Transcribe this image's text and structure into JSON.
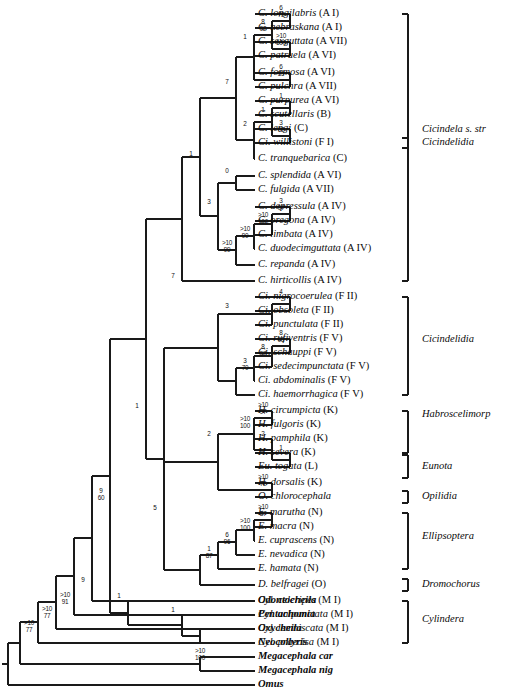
{
  "figure": {
    "type": "phylogenetic-cladogram",
    "width": 517,
    "height": 697,
    "line_color": "#1a1a1a",
    "text_color": "#0a0a0a",
    "background": "#ffffff"
  },
  "taxa": [
    {
      "name": "C. longilabris",
      "code": "(A I)",
      "outgroup": false,
      "y": 14
    },
    {
      "name": "C. nebraskana",
      "code": "(A I)",
      "outgroup": false,
      "y": 28
    },
    {
      "name": "C. sexguttata",
      "code": "(A VII)",
      "outgroup": false,
      "y": 42
    },
    {
      "name": "C. patruela",
      "code": "(A VI)",
      "outgroup": false,
      "y": 56
    },
    {
      "name": "C. formosa",
      "code": "(A VI)",
      "outgroup": false,
      "y": 73
    },
    {
      "name": "C. pulchra",
      "code": "(A VII)",
      "outgroup": false,
      "y": 87
    },
    {
      "name": "C. purpurea",
      "code": "(A VI)",
      "outgroup": false,
      "y": 101
    },
    {
      "name": "C. scutellaris",
      "code": "(B)",
      "outgroup": false,
      "y": 115
    },
    {
      "name": "C. lengi",
      "code": "(C)",
      "outgroup": false,
      "y": 129
    },
    {
      "name": "Ci. willistoni",
      "code": "(F I)",
      "outgroup": false,
      "y": 143
    },
    {
      "name": "C. tranquebarica",
      "code": "(C)",
      "outgroup": false,
      "y": 159
    },
    {
      "name": "C. splendida",
      "code": "(A VI)",
      "outgroup": false,
      "y": 176
    },
    {
      "name": "C. fulgida",
      "code": "(A VII)",
      "outgroup": false,
      "y": 190
    },
    {
      "name": "C. depressula",
      "code": "(A IV)",
      "outgroup": false,
      "y": 207
    },
    {
      "name": "C. oregona",
      "code": "(A IV)",
      "outgroup": false,
      "y": 221
    },
    {
      "name": "C. limbata",
      "code": "(A IV)",
      "outgroup": false,
      "y": 235
    },
    {
      "name": "C. duodecimguttata",
      "code": "(A  IV)",
      "outgroup": false,
      "y": 249
    },
    {
      "name": "C. repanda",
      "code": "(A IV)",
      "outgroup": false,
      "y": 265
    },
    {
      "name": "C. hirticollis",
      "code": "(A IV)",
      "outgroup": false,
      "y": 281
    },
    {
      "name": "Ci. nigrocoerulea",
      "code": "(F II)",
      "outgroup": false,
      "y": 297
    },
    {
      "name": "Ci. obsoleta",
      "code": "(F II)",
      "outgroup": false,
      "y": 311
    },
    {
      "name": "Ci. punctulata",
      "code": "(F II)",
      "outgroup": false,
      "y": 325
    },
    {
      "name": "Ci. rufiventris",
      "code": "(F V)",
      "outgroup": false,
      "y": 339
    },
    {
      "name": "Ci. schauppi",
      "code": "(F V)",
      "outgroup": false,
      "y": 353
    },
    {
      "name": "Ci. sedecimpunctata",
      "code": "(F V)",
      "outgroup": false,
      "y": 367
    },
    {
      "name": "Ci. abdominalis",
      "code": "(F V)",
      "outgroup": false,
      "y": 381
    },
    {
      "name": "Ci. haemorrhagica",
      "code": "(F V)",
      "outgroup": false,
      "y": 395
    },
    {
      "name": "H. circumpicta",
      "code": "(K)",
      "outgroup": false,
      "y": 411
    },
    {
      "name": "H. fulgoris",
      "code": "(K)",
      "outgroup": false,
      "y": 425
    },
    {
      "name": "H. pamphila",
      "code": "(K)",
      "outgroup": false,
      "y": 439
    },
    {
      "name": "H. severa",
      "code": "(K)",
      "outgroup": false,
      "y": 453
    },
    {
      "name": "Eu. togata",
      "code": "(L)",
      "outgroup": false,
      "y": 467
    },
    {
      "name": "H. dorsalis",
      "code": "(K)",
      "outgroup": false,
      "y": 483
    },
    {
      "name": "O. chlorocephala",
      "code": "",
      "outgroup": false,
      "y": 497
    },
    {
      "name": "E. marutha",
      "code": "(N)",
      "outgroup": false,
      "y": 513
    },
    {
      "name": "E. macra",
      "code": "(N)",
      "outgroup": false,
      "y": 527
    },
    {
      "name": "E. cuprascens",
      "code": "(N)",
      "outgroup": false,
      "y": 541
    },
    {
      "name": "E. nevadica",
      "code": "(N)",
      "outgroup": false,
      "y": 555
    },
    {
      "name": "E. hamata",
      "code": "(N)",
      "outgroup": false,
      "y": 569
    },
    {
      "name": "D. belfragei",
      "code": "(O)",
      "outgroup": false,
      "y": 585
    },
    {
      "name": "Cyl. celeripes",
      "code": "(M I)",
      "outgroup": false,
      "y": 601
    },
    {
      "name": "Cyl. unipunctata",
      "code": "(M I)",
      "outgroup": false,
      "y": 615
    },
    {
      "name": "Cyl. lemniscata",
      "code": "(M I)",
      "outgroup": false,
      "y": 629
    },
    {
      "name": "Cyl. praecisa",
      "code": "(M I)",
      "outgroup": false,
      "y": 643
    },
    {
      "name": "Odontocheila",
      "code": "",
      "outgroup": true,
      "y": 601
    },
    {
      "name": "Pentachomia",
      "code": "",
      "outgroup": true,
      "y": 615
    },
    {
      "name": "Oxycheila",
      "code": "",
      "outgroup": true,
      "y": 629
    },
    {
      "name": "Neocollyris",
      "code": "",
      "outgroup": true,
      "y": 643
    },
    {
      "name": "Megacephala car",
      "code": "",
      "outgroup": true,
      "y": 657
    },
    {
      "name": "Megacephala nig",
      "code": "",
      "outgroup": true,
      "y": 671
    },
    {
      "name": "Omus",
      "code": "",
      "outgroup": true,
      "y": 685
    }
  ],
  "tip_layout": {
    "label_x": 258,
    "outgroup_indices": [
      44,
      45,
      46,
      47,
      48,
      49,
      50
    ],
    "tip_y_values": [
      14,
      28,
      42,
      56,
      73,
      87,
      101,
      115,
      129,
      143,
      159,
      176,
      190,
      207,
      221,
      235,
      249,
      265,
      281,
      297,
      311,
      325,
      339,
      353,
      367,
      381,
      395,
      411,
      425,
      439,
      453,
      467,
      483,
      497,
      513,
      527,
      541,
      555,
      569,
      585,
      601,
      615,
      629,
      643,
      601,
      615,
      629,
      643,
      657,
      671,
      685
    ]
  },
  "support_values": [
    {
      "id": "n-longi-nebr",
      "top": "6",
      "bottom": "73",
      "x": 281,
      "y": 14
    },
    {
      "id": "n-sexg-patr",
      "top": ">10",
      "bottom": "100",
      "x": 281,
      "y": 42
    },
    {
      "id": "n-clade-4",
      "top": "8",
      "bottom": "92",
      "x": 263,
      "y": 28
    },
    {
      "id": "n-form-pulc",
      "top": "6",
      "bottom": "55",
      "x": 281,
      "y": 73
    },
    {
      "id": "n-upper-1",
      "top": "1",
      "bottom": "",
      "x": 245,
      "y": 42
    },
    {
      "id": "n-purp-scut",
      "top": "1",
      "bottom": "",
      "x": 281,
      "y": 101
    },
    {
      "id": "n-lengi-will",
      "top": "3",
      "bottom": "62",
      "x": 281,
      "y": 129
    },
    {
      "id": "n-clade-purp",
      "top": "1",
      "bottom": "",
      "x": 263,
      "y": 115
    },
    {
      "id": "n-clade-tranq",
      "top": "2",
      "bottom": "",
      "x": 245,
      "y": 129
    },
    {
      "id": "n-cic-sstr",
      "top": "7",
      "bottom": "",
      "x": 227,
      "y": 87
    },
    {
      "id": "n-splen-fulg",
      "top": "0",
      "bottom": "",
      "x": 227,
      "y": 176
    },
    {
      "id": "n-depr-oreg",
      "top": "3",
      "bottom": "97",
      "x": 281,
      "y": 207
    },
    {
      "id": "n-limb",
      "top": ">10",
      "bottom": "100",
      "x": 263,
      "y": 221
    },
    {
      "id": "n-duod",
      "top": ">10",
      "bottom": "90",
      "x": 245,
      "y": 235
    },
    {
      "id": "n-repa",
      "top": ">10",
      "bottom": "99",
      "x": 227,
      "y": 249
    },
    {
      "id": "n-hirt",
      "top": "3",
      "bottom": "",
      "x": 209,
      "y": 207
    },
    {
      "id": "n-cic-all",
      "top": "1",
      "bottom": "",
      "x": 191,
      "y": 159
    },
    {
      "id": "n-nigro-obso",
      "top": "4",
      "bottom": "",
      "x": 281,
      "y": 297
    },
    {
      "id": "n-punct",
      "top": "3",
      "bottom": "",
      "x": 227,
      "y": 311
    },
    {
      "id": "n-rufi-scha",
      "top": "8",
      "bottom": "93",
      "x": 281,
      "y": 339
    },
    {
      "id": "n-sede",
      "top": "8",
      "bottom": "97",
      "x": 263,
      "y": 353
    },
    {
      "id": "n-abdo",
      "top": "3",
      "bottom": "70",
      "x": 245,
      "y": 367
    },
    {
      "id": "n-cicindelidia-root",
      "top": "7",
      "bottom": "",
      "x": 173,
      "y": 281
    },
    {
      "id": "n-circ-fulg",
      "top": ">10",
      "bottom": "97",
      "x": 263,
      "y": 411
    },
    {
      "id": "n-pamp",
      "top": ">10",
      "bottom": "100",
      "x": 245,
      "y": 425
    },
    {
      "id": "n-seve-toga",
      "top": "1",
      "bottom": "",
      "x": 281,
      "y": 453
    },
    {
      "id": "n-habro-sub",
      "top": "2",
      "bottom": "",
      "x": 263,
      "y": 439
    },
    {
      "id": "n-dors-chlo",
      "top": ">10",
      "bottom": "72",
      "x": 263,
      "y": 483
    },
    {
      "id": "n-habro-root",
      "top": "2",
      "bottom": "",
      "x": 209,
      "y": 439
    },
    {
      "id": "n-maru-macr",
      "top": ">10",
      "bottom": "87",
      "x": 263,
      "y": 513
    },
    {
      "id": "n-cupr",
      "top": ">10",
      "bottom": "100",
      "x": 245,
      "y": 527
    },
    {
      "id": "n-neva",
      "top": "6",
      "bottom": "96",
      "x": 227,
      "y": 541
    },
    {
      "id": "n-hama",
      "top": "1",
      "bottom": "87",
      "x": 209,
      "y": 555
    },
    {
      "id": "n-ellips-dromo",
      "top": "5",
      "bottom": "",
      "x": 155,
      "y": 513
    },
    {
      "id": "n-upper-big",
      "top": "1",
      "bottom": "",
      "x": 137,
      "y": 411
    },
    {
      "id": "n-cyl-sub",
      "top": "1",
      "bottom": "",
      "x": 173,
      "y": 615
    },
    {
      "id": "n-cyl-all",
      "top": "1",
      "bottom": "",
      "x": 119,
      "y": 601
    },
    {
      "id": "n-odonto",
      "top": "9",
      "bottom": "60",
      "x": 101,
      "y": 497
    },
    {
      "id": "n-penta",
      "top": "9",
      "bottom": "",
      "x": 83,
      "y": 585
    },
    {
      "id": "n-oxy",
      "top": ">10",
      "bottom": "91",
      "x": 65,
      "y": 601
    },
    {
      "id": "n-neoc",
      "top": ">10",
      "bottom": "77",
      "x": 47,
      "y": 615
    },
    {
      "id": "n-mega",
      "top": ">10",
      "bottom": "77",
      "x": 29,
      "y": 629
    },
    {
      "id": "n-mega-pair",
      "top": ">10",
      "bottom": "100",
      "x": 200,
      "y": 657
    }
  ],
  "clade_brackets": [
    {
      "label": "Cicindela s. str",
      "top": 14,
      "bottom": 281,
      "label_y": 130,
      "style": "plain"
    },
    {
      "label": "Cicindelidia",
      "top": 138,
      "bottom": 148,
      "label_y": 143,
      "style": "small"
    },
    {
      "label": "Cicindelidia",
      "top": 297,
      "bottom": 395,
      "label_y": 340,
      "style": "plain"
    },
    {
      "label": "Habroscelimorp",
      "top": 411,
      "bottom": 453,
      "label_y": 415,
      "style": "plain"
    },
    {
      "label": "Eunota",
      "top": 455,
      "bottom": 478,
      "label_y": 467,
      "style": "small"
    },
    {
      "label": "Opilidia",
      "top": 491,
      "bottom": 503,
      "label_y": 497,
      "style": "small"
    },
    {
      "label": "Ellipsoptera",
      "top": 513,
      "bottom": 569,
      "label_y": 537,
      "style": "plain"
    },
    {
      "label": "Dromochorus",
      "top": 579,
      "bottom": 591,
      "label_y": 585,
      "style": "small"
    },
    {
      "label": "Cylindera",
      "top": 601,
      "bottom": 643,
      "label_y": 620,
      "style": "plain"
    }
  ],
  "bracket_layout": {
    "x": 408,
    "tick": 6,
    "label_x": 422
  }
}
